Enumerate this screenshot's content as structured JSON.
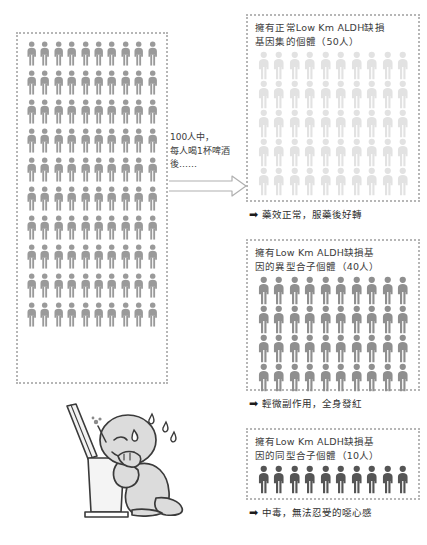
{
  "figure": {
    "title_hidden": "",
    "colors": {
      "person_left": "#9a9a9a",
      "person_normal": "#e2e2e2",
      "person_hetero": "#8f8f8f",
      "person_homo": "#555555",
      "panel_border": "#b6b6b6",
      "text": "#3c3c3c"
    }
  },
  "left_group": {
    "name": "total-population",
    "count": 100,
    "rows": 10,
    "cols": 10,
    "person_color": "#9a9a9a"
  },
  "flow": {
    "caption": "100人中，\n每人喝1杯啤酒\n後……",
    "arrow_icon": "right-arrow-icon"
  },
  "panels": [
    {
      "id": "normal",
      "label": "擁有正常Low Km ALDH缺損\n基因集的個體（50人）",
      "count": 50,
      "rows": 5,
      "cols": 10,
      "person_color": "#e2e2e2",
      "outcome": "藥效正常，服藥後好轉",
      "outcome_arrow": "➡"
    },
    {
      "id": "heterozygote",
      "label": "擁有Low Km ALDH缺損基\n因的異型合子個體（40人）",
      "count": 40,
      "rows": 4,
      "cols": 10,
      "person_color": "#8f8f8f",
      "outcome": "輕微副作用，全身發紅",
      "outcome_arrow": "➡"
    },
    {
      "id": "homozygote",
      "label": "擁有Low Km ALDH缺損基\n因的同型合子個體（10人）",
      "count": 10,
      "rows": 1,
      "cols": 10,
      "person_color": "#555555",
      "outcome": "中毒，無法忍受的噁心感",
      "outcome_arrow": "➡"
    }
  ],
  "illustration": {
    "name": "person-vomiting-into-toilet",
    "description": "跪在馬桶前嘔吐的人"
  }
}
